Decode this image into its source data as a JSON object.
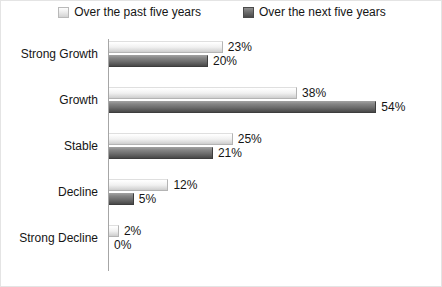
{
  "legend": {
    "entries": [
      {
        "label": "Over the past five years",
        "swatch": "legend-swatch-past",
        "color": "#e8e8e8"
      },
      {
        "label": "Over the next five years",
        "swatch": "legend-swatch-next",
        "color": "#5f5f5f"
      }
    ]
  },
  "chart_data": {
    "type": "bar",
    "orientation": "horizontal",
    "title": "",
    "subtitle": "",
    "xlabel": "",
    "ylabel": "",
    "xlim": [
      0,
      60
    ],
    "grid": false,
    "legend_position": "top-center",
    "value_suffix": "%",
    "categories": [
      "Strong Growth",
      "Growth",
      "Stable",
      "Decline",
      "Strong Decline"
    ],
    "series": [
      {
        "name": "Over the past five years",
        "color": "#e8e8e8",
        "values": [
          23,
          38,
          25,
          12,
          2
        ],
        "labels": [
          "23%",
          "38%",
          "25%",
          "12%",
          "2%"
        ]
      },
      {
        "name": "Over the next five years",
        "color": "#5f5f5f",
        "values": [
          20,
          54,
          21,
          5,
          0
        ],
        "labels": [
          "20%",
          "54%",
          "21%",
          "5%",
          "0%"
        ]
      }
    ]
  }
}
